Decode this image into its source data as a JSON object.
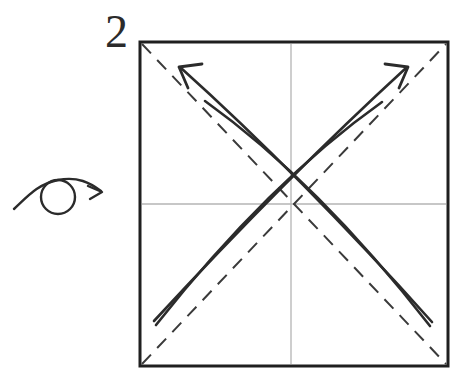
{
  "figure": {
    "kind": "origami-instruction-diagram",
    "step_number": "2",
    "background_color": "#ffffff",
    "ink_color": "#2b2b2b",
    "crease_color": "#3a3a3a",
    "guide_color": "#b4b4b4"
  },
  "turn_over_symbol": {
    "label": "turn over",
    "circle": {
      "cx": 58,
      "cy": 197,
      "r": 17
    },
    "tail_start": {
      "x": 14,
      "y": 209
    },
    "arrow_tip": {
      "x": 101,
      "y": 191
    }
  },
  "paper": {
    "shape": "square",
    "x": 140,
    "y": 42,
    "width": 308,
    "height": 324,
    "stroke_width": 3,
    "stroke_color": "#1f1f1f",
    "fill": "#ffffff"
  },
  "guides": [
    {
      "name": "center-vertical-guide",
      "x1": 291,
      "y1": 44,
      "x2": 291,
      "y2": 364
    },
    {
      "name": "center-horizontal-guide",
      "x1": 142,
      "y1": 204,
      "x2": 446,
      "y2": 204
    }
  ],
  "creases": [
    {
      "name": "crease-diagonal-tl-br",
      "style": "dashed",
      "x1": 142,
      "y1": 44,
      "x2": 446,
      "y2": 364
    },
    {
      "name": "crease-diagonal-bl-tr",
      "style": "dashed",
      "x1": 142,
      "y1": 364,
      "x2": 446,
      "y2": 44
    }
  ],
  "fold_arrows": [
    {
      "name": "fold-arrow-upper-left-outer",
      "direction": "up-left",
      "has_arrowhead": true,
      "start": {
        "x": 432,
        "y": 322
      },
      "control": {
        "x": 300,
        "y": 175
      },
      "end": {
        "x": 181,
        "y": 68
      }
    },
    {
      "name": "fold-arrow-upper-left-inner",
      "direction": "up-left",
      "has_arrowhead": false,
      "start": {
        "x": 430,
        "y": 326
      },
      "control": {
        "x": 318,
        "y": 182
      },
      "end": {
        "x": 205,
        "y": 101
      }
    },
    {
      "name": "fold-arrow-upper-right-outer",
      "direction": "up-right",
      "has_arrowhead": true,
      "start": {
        "x": 154,
        "y": 321
      },
      "control": {
        "x": 288,
        "y": 176
      },
      "end": {
        "x": 406,
        "y": 68
      }
    },
    {
      "name": "fold-arrow-upper-right-inner",
      "direction": "up-right",
      "has_arrowhead": false,
      "start": {
        "x": 156,
        "y": 325
      },
      "control": {
        "x": 268,
        "y": 183
      },
      "end": {
        "x": 382,
        "y": 102
      }
    }
  ]
}
